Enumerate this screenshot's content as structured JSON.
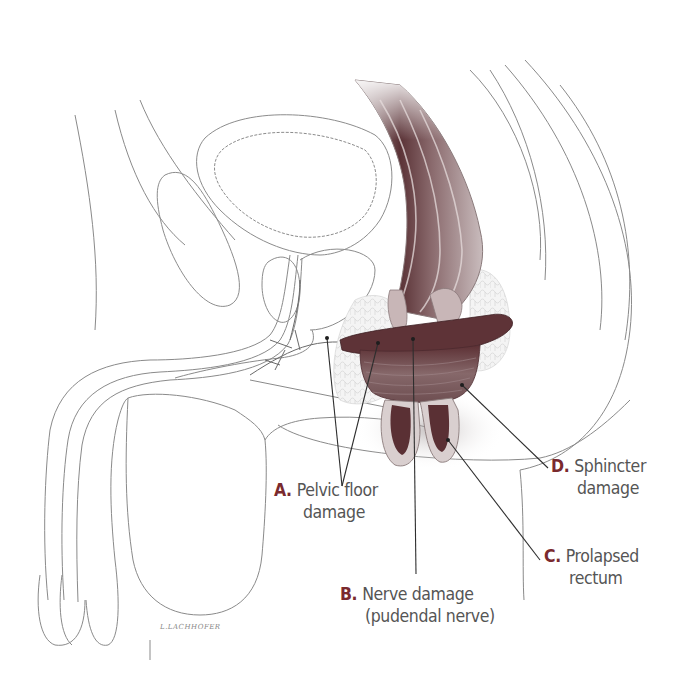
{
  "figure": {
    "accent_color": "#7a2a2e",
    "text_color": "#555555",
    "tissue_color": "#6b4448"
  },
  "labels": [
    {
      "id": "A",
      "letter": "A.",
      "line1": "Pelvic floor",
      "line2": "damage"
    },
    {
      "id": "B",
      "letter": "B.",
      "line1": "Nerve damage",
      "line2": "(pudendal nerve)"
    },
    {
      "id": "C",
      "letter": "C.",
      "line1": "Prolapsed",
      "line2": "rectum"
    },
    {
      "id": "D",
      "letter": "D.",
      "line1": "Sphincter",
      "line2": "damage"
    }
  ],
  "signature": "L.LACHHOFER"
}
